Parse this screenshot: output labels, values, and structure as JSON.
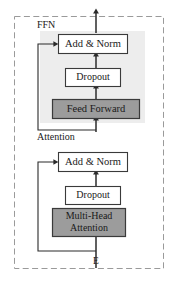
{
  "diagram": {
    "outer_border_style": "dashed",
    "colors": {
      "page_background": "#ffffff",
      "outer_border": "#9a9a9a",
      "panel_fill": "#ededed",
      "block_stroke": "#3a3a3a",
      "block_fill_white": "#ffffff",
      "block_fill_gray": "#9c9c9c",
      "arrow": "#2b2b2b",
      "text": "#1a1a1a"
    },
    "sections": [
      {
        "id": "ffn",
        "label": "FFN",
        "shaded": true,
        "blocks": [
          "add-norm-ffn",
          "dropout-ffn",
          "feed-forward"
        ]
      },
      {
        "id": "attention",
        "label": "Attention",
        "shaded": false,
        "blocks": [
          "add-norm-attn",
          "dropout-attn",
          "multi-head-attention"
        ]
      }
    ],
    "labels": {
      "ffn": "FFN",
      "attention": "Attention",
      "input": "E"
    },
    "blocks": [
      {
        "id": "add-norm-ffn",
        "text": "Add & Norm",
        "fill": "white",
        "lines": [
          "Add & Norm"
        ]
      },
      {
        "id": "dropout-ffn",
        "text": "Dropout",
        "fill": "white",
        "lines": [
          "Dropout"
        ]
      },
      {
        "id": "feed-forward",
        "text": "Feed Forward",
        "fill": "gray",
        "lines": [
          "Feed Forward"
        ]
      },
      {
        "id": "add-norm-attn",
        "text": "Add & Norm",
        "fill": "white",
        "lines": [
          "Add & Norm"
        ]
      },
      {
        "id": "dropout-attn",
        "text": "Dropout",
        "fill": "white",
        "lines": [
          "Dropout"
        ]
      },
      {
        "id": "multi-head-attention",
        "text": "Multi-Head Attention",
        "fill": "gray",
        "lines": [
          "Multi-Head",
          "Attention"
        ]
      }
    ],
    "block_text": {
      "add_norm_ffn": "Add & Norm",
      "dropout_ffn": "Dropout",
      "feed_forward": "Feed Forward",
      "add_norm_attn": "Add & Norm",
      "dropout_attn": "Dropout",
      "multi_head_line1": "Multi-Head",
      "multi_head_line2": "Attention"
    },
    "connections": [
      {
        "from": "E",
        "to": "multi-head-attention",
        "kind": "arrow"
      },
      {
        "from": "multi-head-attention",
        "to": "dropout-attn",
        "kind": "arrow"
      },
      {
        "from": "dropout-attn",
        "to": "add-norm-attn",
        "kind": "arrow"
      },
      {
        "from": "E",
        "to": "add-norm-attn",
        "kind": "residual-arrow"
      },
      {
        "from": "add-norm-attn",
        "to": "feed-forward",
        "kind": "arrow"
      },
      {
        "from": "feed-forward",
        "to": "dropout-ffn",
        "kind": "arrow"
      },
      {
        "from": "dropout-ffn",
        "to": "add-norm-ffn",
        "kind": "arrow"
      },
      {
        "from": "add-norm-attn-output",
        "to": "add-norm-ffn",
        "kind": "residual-arrow"
      },
      {
        "from": "add-norm-ffn",
        "to": "output",
        "kind": "arrow"
      }
    ]
  }
}
